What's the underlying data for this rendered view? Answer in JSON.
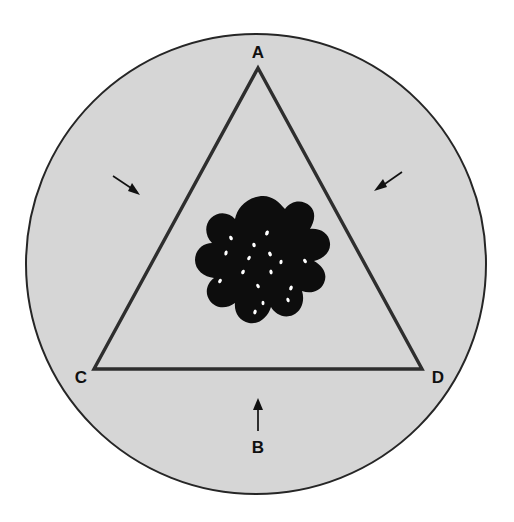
{
  "figure": {
    "canvas": {
      "width": 514,
      "height": 522,
      "background": "#ffffff"
    },
    "colors": {
      "outside": "#ffffff",
      "disc_fill": "#d6d6d6",
      "disc_stroke": "#262626",
      "triangle_stroke": "#2e2e2e",
      "blob_fill": "#0d0d0d",
      "speckle_fill": "#ffffff",
      "label_text": "#101010",
      "arrow_color": "#111111"
    },
    "disc": {
      "name": "outer-circle",
      "center_x": 256,
      "center_y": 264,
      "radius": 230,
      "stroke_width": 2
    },
    "triangle": {
      "name": "triangle-outline",
      "stroke_width": 3.4,
      "apex": {
        "x": 258,
        "y": 68
      },
      "bottom_left": {
        "x": 94,
        "y": 369
      },
      "bottom_right": {
        "x": 422,
        "y": 369
      }
    },
    "blob": {
      "name": "dark-irregular-blob",
      "center_x": 261,
      "center_y": 266,
      "bounds": {
        "left": 194,
        "top": 196,
        "right": 329,
        "bottom": 338
      }
    },
    "labels": [
      {
        "id": "A",
        "text": "A",
        "x": 258,
        "y": 58,
        "anchor": "middle",
        "role": "apex-vertex-label"
      },
      {
        "id": "B",
        "text": "B",
        "x": 258,
        "y": 453,
        "anchor": "middle",
        "role": "bottom-arrow-label"
      },
      {
        "id": "C",
        "text": "C",
        "x": 81,
        "y": 383,
        "anchor": "middle",
        "role": "bottom-left-vertex-label"
      },
      {
        "id": "D",
        "text": "D",
        "x": 438,
        "y": 383,
        "anchor": "middle",
        "role": "bottom-right-vertex-label"
      }
    ],
    "arrows": [
      {
        "id": "arrow-left",
        "name": "arrow-pointing-down-right",
        "tail": {
          "x": 113,
          "y": 176
        },
        "head": {
          "x": 139,
          "y": 194
        },
        "direction": "down-right"
      },
      {
        "id": "arrow-right",
        "name": "arrow-pointing-down-left",
        "tail": {
          "x": 402,
          "y": 172
        },
        "head": {
          "x": 375,
          "y": 190
        },
        "direction": "down-left"
      },
      {
        "id": "arrow-bottom",
        "name": "arrow-pointing-up",
        "tail": {
          "x": 258,
          "y": 431
        },
        "head": {
          "x": 258,
          "y": 399
        },
        "direction": "up"
      }
    ],
    "speckles": [
      {
        "x": 267,
        "y": 233,
        "rx": 1.8,
        "ry": 2.6,
        "rot": 20
      },
      {
        "x": 231,
        "y": 238,
        "rx": 1.7,
        "ry": 2.4,
        "rot": -25
      },
      {
        "x": 226,
        "y": 253,
        "rx": 1.6,
        "ry": 2.5,
        "rot": 15
      },
      {
        "x": 254,
        "y": 245,
        "rx": 1.7,
        "ry": 2.3,
        "rot": -10
      },
      {
        "x": 249,
        "y": 258,
        "rx": 1.6,
        "ry": 2.4,
        "rot": 30
      },
      {
        "x": 270,
        "y": 254,
        "rx": 1.7,
        "ry": 2.5,
        "rot": -20
      },
      {
        "x": 281,
        "y": 262,
        "rx": 1.6,
        "ry": 2.3,
        "rot": 10
      },
      {
        "x": 305,
        "y": 261,
        "rx": 1.6,
        "ry": 2.4,
        "rot": -35
      },
      {
        "x": 243,
        "y": 272,
        "rx": 1.7,
        "ry": 2.4,
        "rot": 25
      },
      {
        "x": 271,
        "y": 272,
        "rx": 1.6,
        "ry": 2.4,
        "rot": -15
      },
      {
        "x": 220,
        "y": 281,
        "rx": 1.6,
        "ry": 2.3,
        "rot": 35
      },
      {
        "x": 258,
        "y": 286,
        "rx": 1.6,
        "ry": 2.4,
        "rot": -30
      },
      {
        "x": 291,
        "y": 288,
        "rx": 1.7,
        "ry": 2.5,
        "rot": 20
      },
      {
        "x": 288,
        "y": 300,
        "rx": 1.6,
        "ry": 2.3,
        "rot": -20
      },
      {
        "x": 255,
        "y": 312,
        "rx": 1.6,
        "ry": 2.4,
        "rot": 15
      },
      {
        "x": 263,
        "y": 303,
        "rx": 1.5,
        "ry": 2.2,
        "rot": -5
      }
    ]
  }
}
